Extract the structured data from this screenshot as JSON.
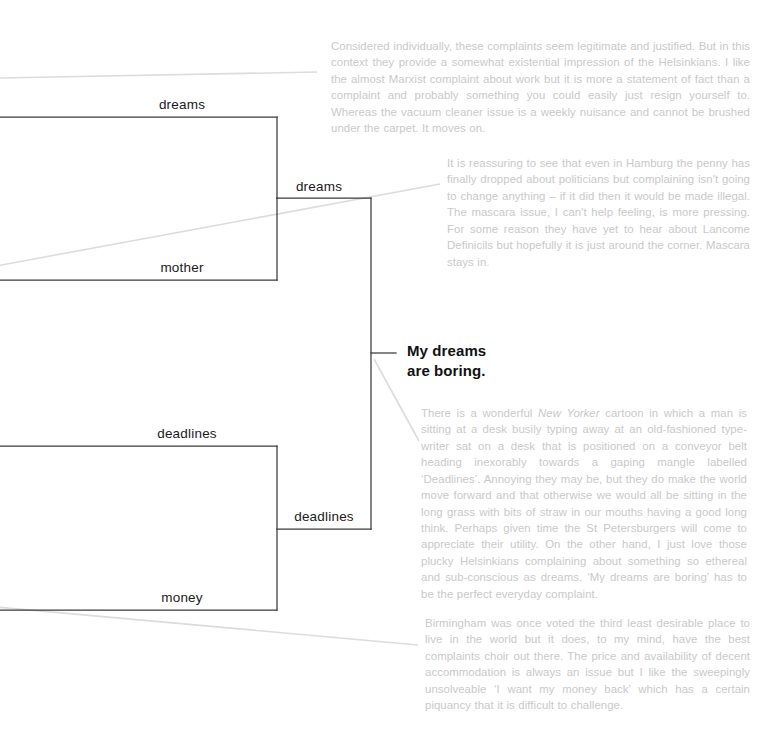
{
  "diagram": {
    "title_node": "My dreams\nare boring.",
    "type": "dendrogram-with-annotations",
    "colors": {
      "background": "#ffffff",
      "tree_line": "#3a3a3a",
      "leader_line": "#d8d8d8",
      "label_text": "#1a1a1a",
      "annotation_text": "#c9c9c9"
    },
    "nodes": [
      {
        "id": "leaf-dreams-top",
        "label": "dreams"
      },
      {
        "id": "leaf-mother",
        "label": "mother"
      },
      {
        "id": "cluster-dreams",
        "label": "dreams"
      },
      {
        "id": "leaf-deadlines-top",
        "label": "deadlines"
      },
      {
        "id": "leaf-money",
        "label": "money"
      },
      {
        "id": "cluster-deadlines",
        "label": "deadlines"
      }
    ]
  },
  "annotations": [
    {
      "id": "annotation-helsinki-complaints",
      "text": "Considered individually, these complaints seem legitimate and justified. But in this context they provide a somewhat existential impression of the Helsinkians. I like the almost Marxist complaint about work but it is more a statement of fact than a complaint and probably something you could easily just resign yourself to. Whereas the vacuum cleaner issue is a weekly nuisance and cannot be brushed under the carpet. It moves on."
    },
    {
      "id": "annotation-hamburg-mascara",
      "text": "It is reassuring to see that even in Hamburg the penny has finally dropped about politicians but complaining isn't going to change anything – if it did then it would be made illegal. The mascara issue, I can't help feeling, is more pressing. For some reason they have yet to hear about Lancome Definicils but hopefully it is just around the corner. Mascara stays in."
    },
    {
      "id": "annotation-new-yorker-deadlines",
      "text_before_italic": "There is a wonderful ",
      "italic_text": "New Yorker",
      "text_after_italic": " cartoon in which a man is sitting at a desk busily typing away at an old-fashioned type-writer sat on a desk that is positioned on a conveyor belt heading inexorably towards a gaping mangle labelled ‘Deadlines’. Annoying they may be, but they do make the world move forward and that otherwise we would all be sitting in the long grass with bits of straw in our mouths having a good long think. Perhaps given time the St Petersburgers will come to appreciate their utility. On the other hand, I just love those plucky Helsinkians complaining about something so ethereal and sub-conscious as dreams. ‘My dreams are boring’ has to be the perfect everyday complaint."
    },
    {
      "id": "annotation-birmingham-money",
      "text": "Birmingham was once voted the third least desirable place to live in the world but it does, to my mind, have the best complaints choir out there. The price and availability of decent accommodation is always an issue but I like the sweepingly unsolveable ‘I want my money back’ which has a certain piquancy that it is difficult to challenge."
    }
  ]
}
